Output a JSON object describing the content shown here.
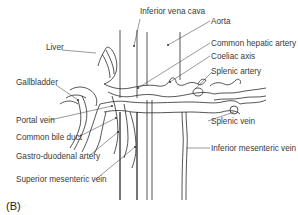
{
  "figure": {
    "panel_label": "(B)",
    "labels": {
      "inferior_vena_cava": "Inferior vena cava",
      "aorta": "Aorta",
      "liver": "Liver",
      "common_hepatic_artery": "Common hepatic artery",
      "coeliac_axis": "Coeliac axis",
      "gallbladder": "Gallbladder",
      "splenic_artery": "Splenic artery",
      "portal_vein": "Portal vein",
      "splenic_vein": "Splenic vein",
      "common_bile_duct": "Common bile duct",
      "gastro_duodenal_artery": "Gastro-duodenal artery",
      "inferior_mesenteric_vein": "Inferior mesenteric vein",
      "superior_mesenteric_vein": "Superior mesenteric vein"
    },
    "colors": {
      "line": "#333333",
      "text": "#3a3a3a",
      "background": "#ffffff"
    }
  }
}
